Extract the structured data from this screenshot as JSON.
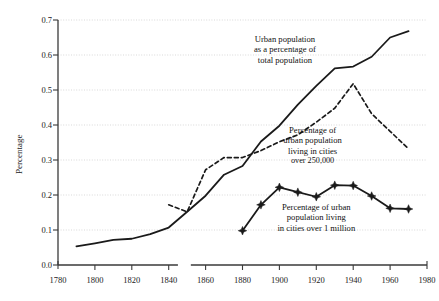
{
  "chart_data": {
    "type": "line",
    "title": "",
    "subtitle": "",
    "xlabel": "",
    "ylabel": "Percentage",
    "xlim": [
      1780,
      1980
    ],
    "ylim": [
      0.0,
      0.7
    ],
    "grid": "horizontal dotted gridlines at each 0.1",
    "legend_position": "inline annotations on curves",
    "x_ticks": [
      1780,
      1800,
      1820,
      1840,
      1860,
      1880,
      1900,
      1920,
      1940,
      1960,
      1980
    ],
    "y_ticks": [
      "0.0",
      "0.1",
      "0.2",
      "0.3",
      "0.4",
      "0.5",
      "0.6",
      "0.7"
    ],
    "axis_break_note": "small break in x-axis between 1845 and 1852",
    "series": [
      {
        "name": "Urban population as a percentage of total population",
        "style": "solid",
        "x": [
          1790,
          1800,
          1810,
          1820,
          1830,
          1840,
          1850,
          1860,
          1870,
          1880,
          1890,
          1900,
          1910,
          1920,
          1930,
          1940,
          1950,
          1960,
          1970
        ],
        "values": [
          0.053,
          0.062,
          0.072,
          0.075,
          0.088,
          0.107,
          0.152,
          0.198,
          0.258,
          0.283,
          0.353,
          0.398,
          0.458,
          0.512,
          0.562,
          0.567,
          0.595,
          0.65,
          0.668
        ]
      },
      {
        "name": "Percentage of urban population living in cities over 250,000",
        "style": "dashed",
        "x": [
          1840,
          1850,
          1860,
          1870,
          1880,
          1890,
          1900,
          1910,
          1920,
          1930,
          1940,
          1950,
          1960,
          1970
        ],
        "values": [
          0.172,
          0.152,
          0.272,
          0.307,
          0.307,
          0.327,
          0.352,
          0.372,
          0.408,
          0.448,
          0.518,
          0.432,
          0.382,
          0.332
        ]
      },
      {
        "name": "Percentage of urban population living in cities over 1 million",
        "style": "solid-with-star-markers",
        "x": [
          1880,
          1890,
          1900,
          1910,
          1920,
          1930,
          1940,
          1950,
          1960,
          1970
        ],
        "values": [
          0.098,
          0.172,
          0.222,
          0.208,
          0.195,
          0.228,
          0.227,
          0.197,
          0.162,
          0.16
        ]
      }
    ],
    "annotations": [
      {
        "id": "annot-urban-total",
        "text": "Urban population\nas a percentage of\ntotal population",
        "x": 1903,
        "y": 0.615
      },
      {
        "id": "annot-over-250k",
        "text": "Percentage of\nurban population\nliving in cities",
        "suffix": "over 250,000",
        "x": 1918,
        "y": 0.355
      },
      {
        "id": "annot-over-1m",
        "text": "Percentage of urban\npopulation living\nin cities over 1 million",
        "x": 1920,
        "y": 0.135
      }
    ],
    "colors": {
      "line": "#1a1a1a",
      "grid": "#c9c9c9",
      "axis": "#3a3a3a",
      "background": "#ffffff",
      "text": "#1a1a1a"
    }
  }
}
